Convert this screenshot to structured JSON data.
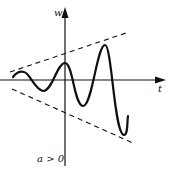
{
  "diagram": {
    "type": "damped/growing oscillation with exponential envelopes",
    "axes": {
      "vertical_label": "w",
      "horizontal_label": "t"
    },
    "condition_label": "a > 0",
    "elements": {
      "curve": "oscillating solid curve with growing amplitude",
      "upper_envelope": "dashed line (increasing)",
      "lower_envelope": "dashed line (decreasing)"
    },
    "colors": {
      "ink": "#111111",
      "background": "#ffffff"
    }
  }
}
